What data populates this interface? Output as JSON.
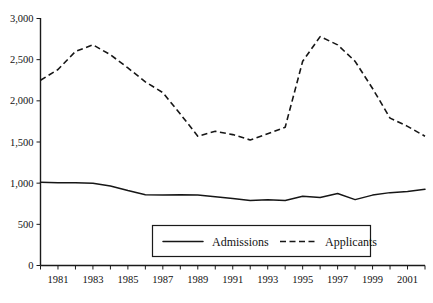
{
  "chart_data": {
    "type": "line",
    "title": "",
    "xlabel": "",
    "ylabel": "",
    "xlim": [
      1980,
      2002
    ],
    "ylim": [
      0,
      3000
    ],
    "grid": false,
    "legend_position": "bottom-center",
    "x": [
      1980,
      1981,
      1982,
      1983,
      1984,
      1985,
      1986,
      1987,
      1988,
      1989,
      1990,
      1991,
      1992,
      1993,
      1994,
      1995,
      1996,
      1997,
      1998,
      1999,
      2000,
      2001,
      2002
    ],
    "xtick_labels": [
      "1981",
      "1983",
      "1985",
      "1987",
      "1989",
      "1991",
      "1993",
      "1995",
      "1997",
      "1999",
      "2001"
    ],
    "xtick_values": [
      1981,
      1983,
      1985,
      1987,
      1989,
      1991,
      1993,
      1995,
      1997,
      1999,
      2001
    ],
    "ytick_labels": [
      "0",
      "500",
      "1,000",
      "1,500",
      "2,000",
      "2,500",
      "3,000"
    ],
    "ytick_values": [
      0,
      500,
      1000,
      1500,
      2000,
      2500,
      3000
    ],
    "series": [
      {
        "name": "Admissions",
        "style": "solid",
        "color": "#161616",
        "values": [
          1010,
          1005,
          1005,
          1000,
          965,
          910,
          860,
          855,
          860,
          855,
          835,
          815,
          790,
          800,
          790,
          840,
          825,
          875,
          800,
          855,
          885,
          900,
          925
        ]
      },
      {
        "name": "Applicants",
        "style": "dashed",
        "color": "#161616",
        "values": [
          2250,
          2380,
          2600,
          2680,
          2560,
          2400,
          2230,
          2100,
          1840,
          1570,
          1630,
          1590,
          1525,
          1600,
          1680,
          2480,
          2780,
          2680,
          2480,
          2150,
          1790,
          1690,
          1570
        ]
      }
    ]
  },
  "legend": {
    "items": [
      {
        "label": "Admissions",
        "style": "solid"
      },
      {
        "label": "Applicants",
        "style": "dashed"
      }
    ]
  }
}
